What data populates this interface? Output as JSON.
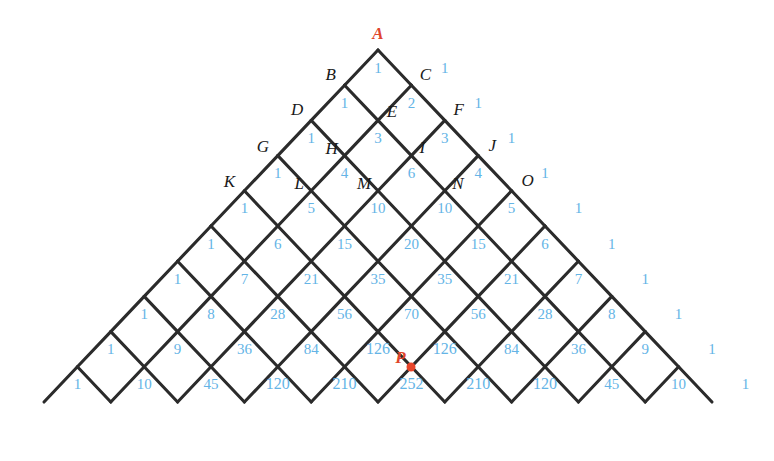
{
  "figure": {
    "apex_label": "A",
    "marked_point_label": "P",
    "accent_color": "#e8452b",
    "number_color": "#64b4e6",
    "line_color": "#2b2b2b",
    "background": "#ffffff"
  },
  "geometry": {
    "apex_x": 378,
    "apex_y": 50,
    "half_width": 33.4,
    "row_height": 35.2,
    "rows": 10
  },
  "chart_data": {
    "type": "diagram-lattice",
    "rows": [
      {
        "n": 1,
        "values": [
          1,
          1
        ]
      },
      {
        "n": 2,
        "values": [
          1,
          2,
          1
        ]
      },
      {
        "n": 3,
        "values": [
          1,
          3,
          3,
          1
        ]
      },
      {
        "n": 4,
        "values": [
          1,
          4,
          6,
          4,
          1
        ]
      },
      {
        "n": 5,
        "values": [
          1,
          5,
          10,
          10,
          5,
          1
        ]
      },
      {
        "n": 6,
        "values": [
          1,
          6,
          15,
          20,
          15,
          6,
          1
        ]
      },
      {
        "n": 7,
        "values": [
          1,
          7,
          21,
          35,
          35,
          21,
          7,
          1
        ]
      },
      {
        "n": 8,
        "values": [
          1,
          8,
          28,
          56,
          70,
          56,
          28,
          8,
          1
        ]
      },
      {
        "n": 9,
        "values": [
          1,
          9,
          36,
          84,
          126,
          126,
          84,
          36,
          9,
          1
        ]
      },
      {
        "n": 10,
        "values": [
          1,
          10,
          45,
          120,
          210,
          252,
          210,
          120,
          45,
          10,
          1
        ]
      }
    ]
  },
  "vertex_labels": [
    {
      "id": "A",
      "text": "A",
      "row": 0,
      "k": 0,
      "highlight": true,
      "dx": 0,
      "dy": -17
    },
    {
      "id": "B",
      "text": "B",
      "row": 1,
      "k": 0,
      "highlight": false,
      "dx": -14,
      "dy": -11
    },
    {
      "id": "C",
      "text": "C",
      "row": 1,
      "k": 1,
      "highlight": false,
      "dx": 14,
      "dy": -11
    },
    {
      "id": "D",
      "text": "D",
      "row": 2,
      "k": 0,
      "highlight": false,
      "dx": -14,
      "dy": -11
    },
    {
      "id": "E",
      "text": "E",
      "row": 2,
      "k": 1,
      "highlight": false,
      "dx": 14,
      "dy": -9
    },
    {
      "id": "F",
      "text": "F",
      "row": 2,
      "k": 2,
      "highlight": false,
      "dx": 14,
      "dy": -11
    },
    {
      "id": "G",
      "text": "G",
      "row": 3,
      "k": 0,
      "highlight": false,
      "dx": -15,
      "dy": -10
    },
    {
      "id": "H",
      "text": "H",
      "row": 3,
      "k": 1,
      "highlight": false,
      "dx": -13,
      "dy": -8
    },
    {
      "id": "I",
      "text": "I",
      "row": 3,
      "k": 2,
      "highlight": false,
      "dx": 11,
      "dy": -9
    },
    {
      "id": "J",
      "text": "J",
      "row": 3,
      "k": 3,
      "highlight": false,
      "dx": 14,
      "dy": -11
    },
    {
      "id": "K",
      "text": "K",
      "row": 4,
      "k": 0,
      "highlight": false,
      "dx": -15,
      "dy": -10
    },
    {
      "id": "L",
      "text": "L",
      "row": 4,
      "k": 1,
      "highlight": false,
      "dx": -12,
      "dy": -8
    },
    {
      "id": "M",
      "text": "M",
      "row": 4,
      "k": 2,
      "highlight": false,
      "dx": -14,
      "dy": -8
    },
    {
      "id": "N",
      "text": "N",
      "row": 4,
      "k": 3,
      "highlight": false,
      "dx": 13,
      "dy": -8
    },
    {
      "id": "O",
      "text": "O",
      "row": 4,
      "k": 4,
      "highlight": false,
      "dx": 16,
      "dy": -11
    },
    {
      "id": "P",
      "text": "P",
      "row": 9,
      "k": 5,
      "highlight": true,
      "dx": -11,
      "dy": -10
    }
  ],
  "marked_dot": {
    "row": 9,
    "k": 5
  }
}
